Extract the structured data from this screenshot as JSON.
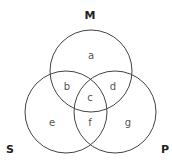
{
  "diagram": {
    "type": "venn-3",
    "sets": {
      "top": {
        "label": "M"
      },
      "left": {
        "label": "S"
      },
      "right": {
        "label": "P"
      }
    },
    "regions": {
      "a": "a",
      "b": "b",
      "c": "c",
      "d": "d",
      "e": "e",
      "f": "f",
      "g": "g"
    },
    "colors": {
      "stroke": "#444444",
      "text": "#555555",
      "label": "#222222"
    }
  }
}
